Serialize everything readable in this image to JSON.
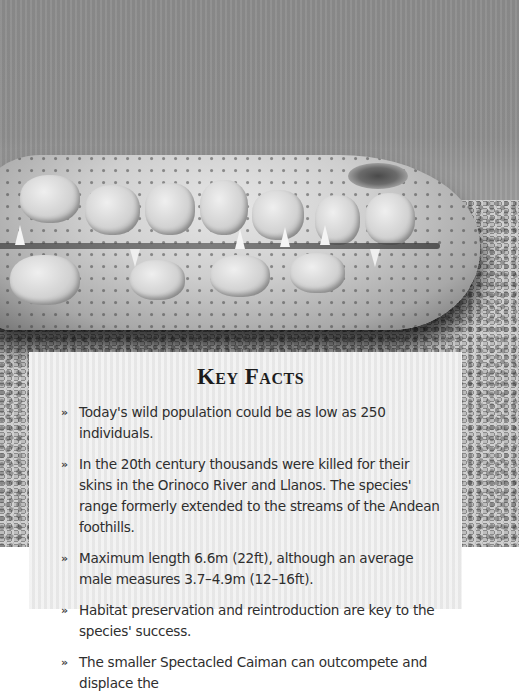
{
  "photo": {
    "subject": "crocodile-snout-on-sand",
    "tone": "black-and-white",
    "background_color": "#8f8f8f"
  },
  "card": {
    "title": "Key Facts",
    "bullet_glyph": "»",
    "background_color": "#ececec",
    "text_color": "#2e2e2e",
    "facts": [
      {
        "text": "Today's wild population could be as low as 250 individuals."
      },
      {
        "text": "In the 20th century thousands were killed for their skins in the Orinoco River and Llanos. The species' range formerly extended to the streams of the Andean foothills."
      },
      {
        "text": "Maximum length 6.6m (22ft), although an average male measures 3.7–4.9m (12–16ft)."
      },
      {
        "text": "Habitat preservation and reintroduction are key to the species' success."
      },
      {
        "text": "The smaller Spectacled Caiman can outcompete and displace the"
      }
    ]
  }
}
